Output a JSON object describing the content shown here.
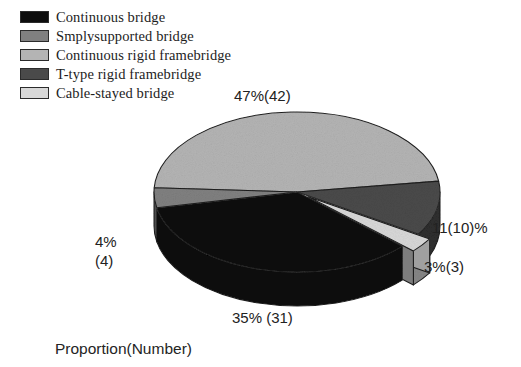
{
  "legend": {
    "items": [
      {
        "label": "Continuous bridge",
        "color": "#0d0d0d",
        "swatch_name": "legend-swatch-continuous-bridge"
      },
      {
        "label": "Smplysupported bridge",
        "color": "#808080",
        "swatch_name": "legend-swatch-smplysupported-bridge"
      },
      {
        "label": "Continuous rigid framebridge",
        "color": "#b4b4b4",
        "swatch_name": "legend-swatch-continuous-rigid-framebridge"
      },
      {
        "label": "T-type rigid framebridge",
        "color": "#4a4a4a",
        "swatch_name": "legend-swatch-t-type-rigid-framebridge"
      },
      {
        "label": "Cable-stayed bridge",
        "color": "#d8d8d8",
        "swatch_name": "legend-swatch-cable-stayed-bridge"
      }
    ]
  },
  "labels": {
    "slice_47": "47%(42)",
    "slice_11": "11(10)%",
    "slice_3": "3%(3)",
    "slice_35": "35% (31)",
    "slice_4_line1": "4%",
    "slice_4_line2": "(4)"
  },
  "caption": "Proportion(Number)",
  "chart_data": {
    "type": "pie",
    "title": "",
    "subtitle": "",
    "xlabel": "",
    "ylabel": "Proportion(Number)",
    "legend_position": "top-left",
    "grid": false,
    "three_d": true,
    "units": "percent",
    "total_count": 90,
    "categories": [
      "Continuous rigid framebridge",
      "Continuous bridge",
      "T-type rigid framebridge",
      "Smplysupported bridge",
      "Cable-stayed bridge"
    ],
    "values": [
      47,
      35,
      11,
      4,
      3
    ],
    "counts": [
      42,
      31,
      10,
      4,
      3
    ],
    "data_labels": [
      "47%(42)",
      "35% (31)",
      "11(10)%",
      "4%\n(4)",
      "3%(3)"
    ],
    "colors": [
      "#b4b4b4",
      "#0d0d0d",
      "#4a4a4a",
      "#808080",
      "#d8d8d8"
    ],
    "exploded": [
      "Cable-stayed bridge"
    ],
    "slices": [
      {
        "name": "Continuous rigid framebridge",
        "percent": 47,
        "count": 42,
        "color": "#b4b4b4",
        "label": "47%(42)"
      },
      {
        "name": "Continuous bridge",
        "percent": 35,
        "count": 31,
        "color": "#0d0d0d",
        "label": "35% (31)"
      },
      {
        "name": "T-type rigid framebridge",
        "percent": 11,
        "count": 10,
        "color": "#4a4a4a",
        "label": "11(10)%"
      },
      {
        "name": "Smplysupported bridge",
        "percent": 4,
        "count": 4,
        "color": "#808080",
        "label": "4% (4)"
      },
      {
        "name": "Cable-stayed bridge",
        "percent": 3,
        "count": 3,
        "color": "#d8d8d8",
        "label": "3%(3)"
      }
    ]
  }
}
